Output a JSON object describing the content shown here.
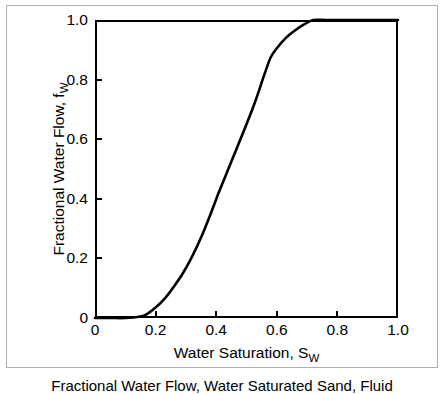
{
  "figure": {
    "caption": "Fractional Water Flow, Water Saturated Sand, Fluid",
    "border_color": "#b0b0b0",
    "background": "#ffffff"
  },
  "chart_data": {
    "type": "line",
    "title": "",
    "xlabel_text": "Water Saturation, S",
    "xlabel_sub": "W",
    "ylabel_text": "Fractional Water Flow, f",
    "ylabel_sub": "W",
    "xlim": [
      0,
      1.0
    ],
    "ylim": [
      0,
      1.0
    ],
    "grid": false,
    "legend": null,
    "line_color": "#000000",
    "line_width": 2.6,
    "xticks": [
      0,
      0.2,
      0.4,
      0.6,
      0.8,
      1.0
    ],
    "xtick_labels": [
      "0",
      "0.2",
      "0.4",
      "0.6",
      "0.8",
      "1.0"
    ],
    "yticks": [
      0,
      0.2,
      0.4,
      0.6,
      0.8,
      1.0
    ],
    "ytick_labels": [
      "0",
      "0.2",
      "0.4",
      "0.6",
      "0.8",
      "1.0"
    ],
    "series": [
      {
        "name": "fractional water flow curve",
        "x": [
          0.0,
          0.05,
          0.1,
          0.15,
          0.17,
          0.2,
          0.23,
          0.26,
          0.29,
          0.32,
          0.35,
          0.38,
          0.41,
          0.44,
          0.47,
          0.5,
          0.53,
          0.56,
          0.58,
          0.6,
          0.63,
          0.66,
          0.69,
          0.72,
          0.76,
          0.8,
          0.85,
          0.9,
          0.95,
          1.0
        ],
        "y": [
          0.0,
          0.0,
          0.0,
          0.005,
          0.012,
          0.035,
          0.065,
          0.105,
          0.15,
          0.205,
          0.27,
          0.345,
          0.425,
          0.5,
          0.575,
          0.65,
          0.73,
          0.82,
          0.875,
          0.905,
          0.94,
          0.965,
          0.985,
          1.0,
          1.0,
          1.0,
          1.0,
          1.0,
          1.0,
          1.0
        ]
      }
    ]
  }
}
